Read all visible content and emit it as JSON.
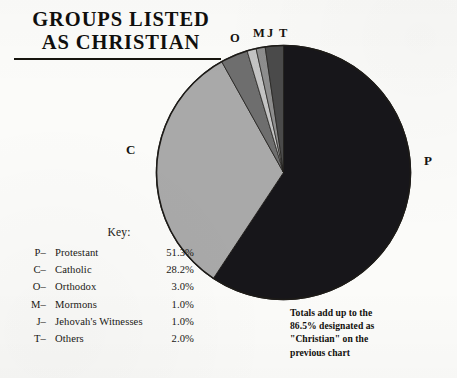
{
  "title": {
    "line1": "GROUPS LISTED",
    "line2": "AS CHRISTIAN"
  },
  "key": {
    "heading": "Key:",
    "columns": [
      "Symbol",
      "Group",
      "Percent"
    ],
    "rows": [
      {
        "symbol": "P–",
        "name": "Protestant",
        "percent": "51.3%"
      },
      {
        "symbol": "C–",
        "name": "Catholic",
        "percent": "28.2%"
      },
      {
        "symbol": "O–",
        "name": "Orthodox",
        "percent": "3.0%"
      },
      {
        "symbol": "M–",
        "name": "Mormons",
        "percent": "1.0%"
      },
      {
        "symbol": "J–",
        "name": "Jehovah's Witnesses",
        "percent": "1.0%"
      },
      {
        "symbol": "T–",
        "name": "Others",
        "percent": "2.0%"
      }
    ]
  },
  "slice_labels": {
    "P": "P",
    "C": "C",
    "O": "O",
    "M": "M",
    "J": "J",
    "T": "T"
  },
  "footnote": {
    "line1": "Totals add up to the",
    "line2": "86.5% designated as",
    "line3": "\"Christian\" on the",
    "line4": "previous chart"
  },
  "colors": {
    "background": "#fbfbf9",
    "ink": "#15130f",
    "slice_P": "#17161a",
    "slice_C": "#a9a9a9",
    "slice_O": "#6e6e6e",
    "slice_M": "#c4c4c4",
    "slice_J": "#8e8e8e",
    "slice_T": "#4a4a4a",
    "outline": "#1d1b18"
  },
  "chart_data": {
    "type": "pie",
    "title": "GROUPS LISTED AS CHRISTIAN",
    "xlabel": "",
    "ylabel": "",
    "total": 86.5,
    "total_label": "86.5%",
    "start_angle_deg": 0,
    "direction": "clockwise",
    "legend": "left-bottom",
    "grid": false,
    "categories": [
      "Protestant",
      "Catholic",
      "Orthodox",
      "Mormons",
      "Jehovah's Witnesses",
      "Others"
    ],
    "values": [
      51.3,
      28.2,
      3.0,
      1.0,
      1.0,
      2.0
    ],
    "labels": [
      "P",
      "C",
      "O",
      "M",
      "J",
      "T"
    ],
    "value_labels": [
      "51.3%",
      "28.2%",
      "3.0%",
      "1.0%",
      "1.0%",
      "2.0%"
    ],
    "colors": [
      "#17161a",
      "#a9a9a9",
      "#6e6e6e",
      "#c4c4c4",
      "#8e8e8e",
      "#4a4a4a"
    ],
    "slices": [
      {
        "label": "P",
        "name": "Protestant",
        "value": 51.3,
        "value_label": "51.3%",
        "color": "#17161a"
      },
      {
        "label": "C",
        "name": "Catholic",
        "value": 28.2,
        "value_label": "28.2%",
        "color": "#a9a9a9"
      },
      {
        "label": "O",
        "name": "Orthodox",
        "value": 3.0,
        "value_label": "3.0%",
        "color": "#6e6e6e"
      },
      {
        "label": "M",
        "name": "Mormons",
        "value": 1.0,
        "value_label": "1.0%",
        "color": "#c4c4c4"
      },
      {
        "label": "J",
        "name": "Jehovah's Witnesses",
        "value": 1.0,
        "value_label": "1.0%",
        "color": "#8e8e8e"
      },
      {
        "label": "T",
        "name": "Others",
        "value": 2.0,
        "value_label": "2.0%",
        "color": "#4a4a4a"
      }
    ],
    "annotations": [
      "Totals add up to the 86.5% designated as \"Christian\" on the previous chart"
    ]
  }
}
